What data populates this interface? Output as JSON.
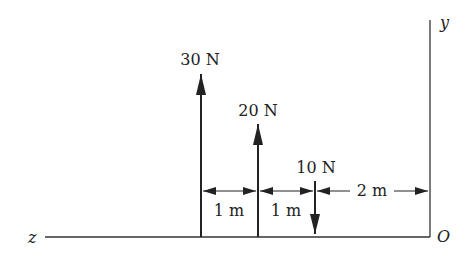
{
  "diagram": {
    "type": "force-diagram",
    "axes": {
      "y_label": "y",
      "z_label": "z",
      "origin_label": "O"
    },
    "forces": [
      {
        "label": "30 N",
        "magnitude": 30,
        "unit": "N",
        "direction": "up"
      },
      {
        "label": "20 N",
        "magnitude": 20,
        "unit": "N",
        "direction": "up"
      },
      {
        "label": "10 N",
        "magnitude": 10,
        "unit": "N",
        "direction": "down"
      }
    ],
    "dimensions": [
      {
        "label": "1 m",
        "between": [
          "30 N",
          "20 N"
        ]
      },
      {
        "label": "1 m",
        "between": [
          "20 N",
          "10 N"
        ]
      },
      {
        "label": "2 m",
        "between": [
          "10 N",
          "y-axis"
        ]
      }
    ],
    "colors": {
      "stroke": "#222222",
      "background": "#ffffff"
    }
  }
}
